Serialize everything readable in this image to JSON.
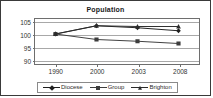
{
  "chart_data": {
    "type": "line",
    "title": "Population",
    "xlabel": "",
    "ylabel": "",
    "categories": [
      "1990",
      "2000",
      "2003",
      "2008"
    ],
    "yticks": [
      90,
      95,
      100,
      105
    ],
    "ylim": [
      88,
      106
    ],
    "grid": true,
    "legend_position": "bottom",
    "series": [
      {
        "name": "Diocese",
        "marker": "diamond",
        "color": "#1f1f1f",
        "values": [
          100,
          103.3,
          102.5,
          101.3
        ]
      },
      {
        "name": "Group",
        "marker": "square",
        "color": "#3d3d3d",
        "values": [
          100,
          97.8,
          97.1,
          96.2
        ]
      },
      {
        "name": "Brighton",
        "marker": "triangle",
        "color": "#2b2b2b",
        "values": [
          100,
          103.3,
          103.0,
          103.0
        ]
      }
    ]
  },
  "axis": {
    "y_labels": [
      "105",
      "100",
      "95",
      "90"
    ],
    "x_labels": [
      "1990",
      "2000",
      "2003",
      "2008"
    ]
  },
  "legend": {
    "items": [
      {
        "label": "Diocese"
      },
      {
        "label": "Group"
      },
      {
        "label": "Brighton"
      }
    ]
  }
}
